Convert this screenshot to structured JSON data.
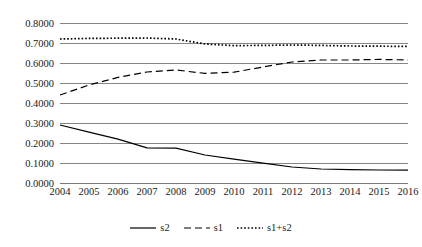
{
  "chart_data": {
    "type": "line",
    "title": "",
    "subtitle": "",
    "xlabel": "",
    "ylabel": "",
    "categories": [
      "2004",
      "2005",
      "2006",
      "2007",
      "2008",
      "2009",
      "2010",
      "2011",
      "2012",
      "2013",
      "2014",
      "2015",
      "2016"
    ],
    "x": [
      2004,
      2005,
      2006,
      2007,
      2008,
      2009,
      2010,
      2011,
      2012,
      2013,
      2014,
      2015,
      2016
    ],
    "ylim": [
      0.0,
      0.8
    ],
    "ytick_labels": [
      "0.8000",
      "0.7000",
      "0.6000",
      "0.5000",
      "0.4000",
      "0.3000",
      "0.2000",
      "0.1000",
      "0.0000"
    ],
    "ytick_values": [
      0.8,
      0.7,
      0.6,
      0.5,
      0.4,
      0.3,
      0.2,
      0.1,
      0.0
    ],
    "grid": "horizontal",
    "legend_position": "bottom",
    "series": [
      {
        "name": "s2",
        "style": "solid",
        "color": "#000000",
        "values": [
          0.29,
          0.254,
          0.219,
          0.176,
          0.1745,
          0.14,
          0.119,
          0.099,
          0.08,
          0.07,
          0.067,
          0.065,
          0.064
        ]
      },
      {
        "name": "s1",
        "style": "dashed",
        "color": "#000000",
        "values": [
          0.44,
          0.49,
          0.528,
          0.555,
          0.565,
          0.548,
          0.554,
          0.58,
          0.605,
          0.615,
          0.615,
          0.618,
          0.615
        ]
      },
      {
        "name": "s1+s2",
        "style": "dotted",
        "color": "#000000",
        "values": [
          0.72,
          0.723,
          0.724,
          0.725,
          0.72,
          0.695,
          0.687,
          0.688,
          0.69,
          0.688,
          0.685,
          0.684,
          0.683
        ]
      }
    ]
  },
  "legend": {
    "items": [
      {
        "label": "s2",
        "style": "solid"
      },
      {
        "label": "s1",
        "style": "dashed"
      },
      {
        "label": "s1+s2",
        "style": "dotted"
      }
    ]
  }
}
